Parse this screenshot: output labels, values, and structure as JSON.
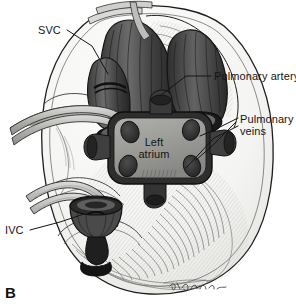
{
  "figure": {
    "panel_letter": "B",
    "artist_signature": "Jm.Gulfer"
  },
  "labels": {
    "svc": "SVC",
    "pulmonary_artery": "Pulmonary artery",
    "pulmonary_veins": "Pulmonary\nveins",
    "left_atrium": "Left\natrium",
    "ivc": "IVC"
  },
  "colors": {
    "background": "#ffffff",
    "ink": "#151515",
    "tissue_light": "#f2f2f0",
    "tissue_mid": "#c9c9c6",
    "vessel_dark": "#4a4a4a",
    "vessel_darkest": "#2b2b2b",
    "atrium_fill": "#9d9d9a",
    "orifice": "#333333",
    "leader_line": "#1a1a1a"
  },
  "structures": [
    {
      "name": "superior-vena-cava",
      "label_key": "svc"
    },
    {
      "name": "aorta-cut-end",
      "label_key": null
    },
    {
      "name": "pulmonary-artery-cut-end",
      "label_key": "pulmonary_artery"
    },
    {
      "name": "left-atrial-cuff",
      "label_key": "left_atrium"
    },
    {
      "name": "pulmonary-vein-orifices",
      "label_key": "pulmonary_veins",
      "count": 4
    },
    {
      "name": "inferior-vena-cava",
      "label_key": "ivc"
    }
  ]
}
